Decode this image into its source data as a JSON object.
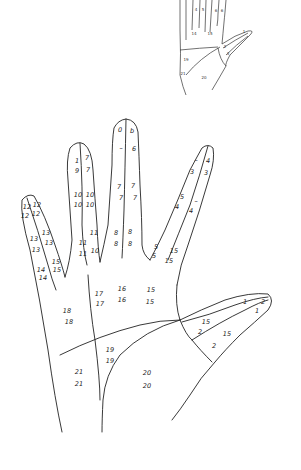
{
  "diagram": {
    "type": "hand-region-map",
    "stroke_color": "#222222",
    "background": "#ffffff"
  },
  "main_hand": {
    "labels": [
      {
        "id": "l1",
        "text": "0",
        "x": 120,
        "y": 130
      },
      {
        "id": "l2",
        "text": "b",
        "x": 132,
        "y": 131
      },
      {
        "id": "l3",
        "text": "–",
        "x": 121,
        "y": 148
      },
      {
        "id": "l4",
        "text": "6",
        "x": 134,
        "y": 149
      },
      {
        "id": "l5",
        "text": "1",
        "x": 77,
        "y": 161
      },
      {
        "id": "l6",
        "text": "7",
        "x": 87,
        "y": 158
      },
      {
        "id": "l7",
        "text": "9",
        "x": 77,
        "y": 171
      },
      {
        "id": "l8",
        "text": "7",
        "x": 88,
        "y": 170
      },
      {
        "id": "l9",
        "text": "10",
        "x": 78,
        "y": 195
      },
      {
        "id": "l10",
        "text": "10",
        "x": 90,
        "y": 195
      },
      {
        "id": "l11",
        "text": "10",
        "x": 78,
        "y": 205
      },
      {
        "id": "l12",
        "text": "10",
        "x": 90,
        "y": 205
      },
      {
        "id": "l13",
        "text": "7",
        "x": 119,
        "y": 187
      },
      {
        "id": "l14",
        "text": "7",
        "x": 133,
        "y": 186
      },
      {
        "id": "l15",
        "text": "7",
        "x": 121,
        "y": 198
      },
      {
        "id": "l16",
        "text": "7",
        "x": 135,
        "y": 198
      },
      {
        "id": "l17",
        "text": "8",
        "x": 116,
        "y": 233
      },
      {
        "id": "l18",
        "text": "8",
        "x": 130,
        "y": 232
      },
      {
        "id": "l19",
        "text": "8",
        "x": 116,
        "y": 244
      },
      {
        "id": "l20",
        "text": "8",
        "x": 130,
        "y": 244
      },
      {
        "id": "l21",
        "text": "11",
        "x": 94,
        "y": 233
      },
      {
        "id": "l22",
        "text": "11",
        "x": 83,
        "y": 243
      },
      {
        "id": "l23",
        "text": "10",
        "x": 95,
        "y": 251
      },
      {
        "id": "l24",
        "text": "11",
        "x": 83,
        "y": 254
      },
      {
        "id": "l25",
        "text": "–",
        "x": 196,
        "y": 160
      },
      {
        "id": "l26",
        "text": "4",
        "x": 208,
        "y": 161
      },
      {
        "id": "l27",
        "text": "3",
        "x": 192,
        "y": 172
      },
      {
        "id": "l28",
        "text": "3",
        "x": 206,
        "y": 173
      },
      {
        "id": "l29",
        "text": "5",
        "x": 182,
        "y": 197
      },
      {
        "id": "l30",
        "text": "–",
        "x": 196,
        "y": 201
      },
      {
        "id": "l31",
        "text": "4",
        "x": 177,
        "y": 207
      },
      {
        "id": "l32",
        "text": "4",
        "x": 191,
        "y": 211
      },
      {
        "id": "l33",
        "text": "5",
        "x": 156,
        "y": 247
      },
      {
        "id": "l34",
        "text": "15",
        "x": 174,
        "y": 251
      },
      {
        "id": "l35",
        "text": "5",
        "x": 154,
        "y": 256
      },
      {
        "id": "l36",
        "text": "15",
        "x": 169,
        "y": 261
      },
      {
        "id": "l37",
        "text": "12",
        "x": 27,
        "y": 207
      },
      {
        "id": "l38",
        "text": "12",
        "x": 37,
        "y": 205
      },
      {
        "id": "l39",
        "text": "12",
        "x": 25,
        "y": 216
      },
      {
        "id": "l40",
        "text": "12",
        "x": 36,
        "y": 214
      },
      {
        "id": "l41",
        "text": "13",
        "x": 34,
        "y": 239
      },
      {
        "id": "l42",
        "text": "13",
        "x": 46,
        "y": 233
      },
      {
        "id": "l43",
        "text": "13",
        "x": 36,
        "y": 250
      },
      {
        "id": "l44",
        "text": "13",
        "x": 49,
        "y": 243
      },
      {
        "id": "l45",
        "text": "14",
        "x": 41,
        "y": 270
      },
      {
        "id": "l46",
        "text": "15",
        "x": 56,
        "y": 262
      },
      {
        "id": "l47",
        "text": "14",
        "x": 43,
        "y": 278
      },
      {
        "id": "l48",
        "text": "15",
        "x": 57,
        "y": 270
      },
      {
        "id": "l49",
        "text": "17",
        "x": 99,
        "y": 294
      },
      {
        "id": "l50",
        "text": "16",
        "x": 122,
        "y": 289
      },
      {
        "id": "l51",
        "text": "15",
        "x": 151,
        "y": 290
      },
      {
        "id": "l52",
        "text": "17",
        "x": 100,
        "y": 304
      },
      {
        "id": "l53",
        "text": "16",
        "x": 122,
        "y": 300
      },
      {
        "id": "l54",
        "text": "15",
        "x": 150,
        "y": 302
      },
      {
        "id": "l55",
        "text": "18",
        "x": 67,
        "y": 311
      },
      {
        "id": "l56",
        "text": "18",
        "x": 69,
        "y": 322
      },
      {
        "id": "l57",
        "text": "19",
        "x": 110,
        "y": 350
      },
      {
        "id": "l58",
        "text": "19",
        "x": 110,
        "y": 361
      },
      {
        "id": "l59",
        "text": "21",
        "x": 79,
        "y": 372
      },
      {
        "id": "l60",
        "text": "21",
        "x": 79,
        "y": 384
      },
      {
        "id": "l61",
        "text": "20",
        "x": 147,
        "y": 373
      },
      {
        "id": "l62",
        "text": "20",
        "x": 147,
        "y": 386
      },
      {
        "id": "l63",
        "text": "15",
        "x": 206,
        "y": 322
      },
      {
        "id": "l64",
        "text": "2",
        "x": 200,
        "y": 332
      },
      {
        "id": "l65",
        "text": "15",
        "x": 227,
        "y": 334
      },
      {
        "id": "l66",
        "text": "2",
        "x": 214,
        "y": 346
      },
      {
        "id": "l67",
        "text": "1",
        "x": 245,
        "y": 302
      },
      {
        "id": "l68",
        "text": "2",
        "x": 263,
        "y": 302
      },
      {
        "id": "l69",
        "text": "1",
        "x": 257,
        "y": 311
      }
    ]
  },
  "thumbnail_hand": {
    "labels": [
      {
        "id": "s1",
        "text": "4",
        "x": 196,
        "y": 10
      },
      {
        "id": "s2",
        "text": "5",
        "x": 203,
        "y": 10
      },
      {
        "id": "s3",
        "text": "6",
        "x": 216,
        "y": 11
      },
      {
        "id": "s4",
        "text": "6",
        "x": 222,
        "y": 11
      },
      {
        "id": "s5",
        "text": "14",
        "x": 194,
        "y": 34
      },
      {
        "id": "s6",
        "text": "15",
        "x": 210,
        "y": 34
      },
      {
        "id": "s7",
        "text": "1",
        "x": 244,
        "y": 32
      },
      {
        "id": "s8",
        "text": "2",
        "x": 225,
        "y": 47
      },
      {
        "id": "s9",
        "text": "3",
        "x": 228,
        "y": 54
      },
      {
        "id": "s10",
        "text": "19",
        "x": 186,
        "y": 60
      },
      {
        "id": "s11",
        "text": "20",
        "x": 204,
        "y": 78
      },
      {
        "id": "s12",
        "text": "21",
        "x": 183,
        "y": 74
      }
    ]
  }
}
